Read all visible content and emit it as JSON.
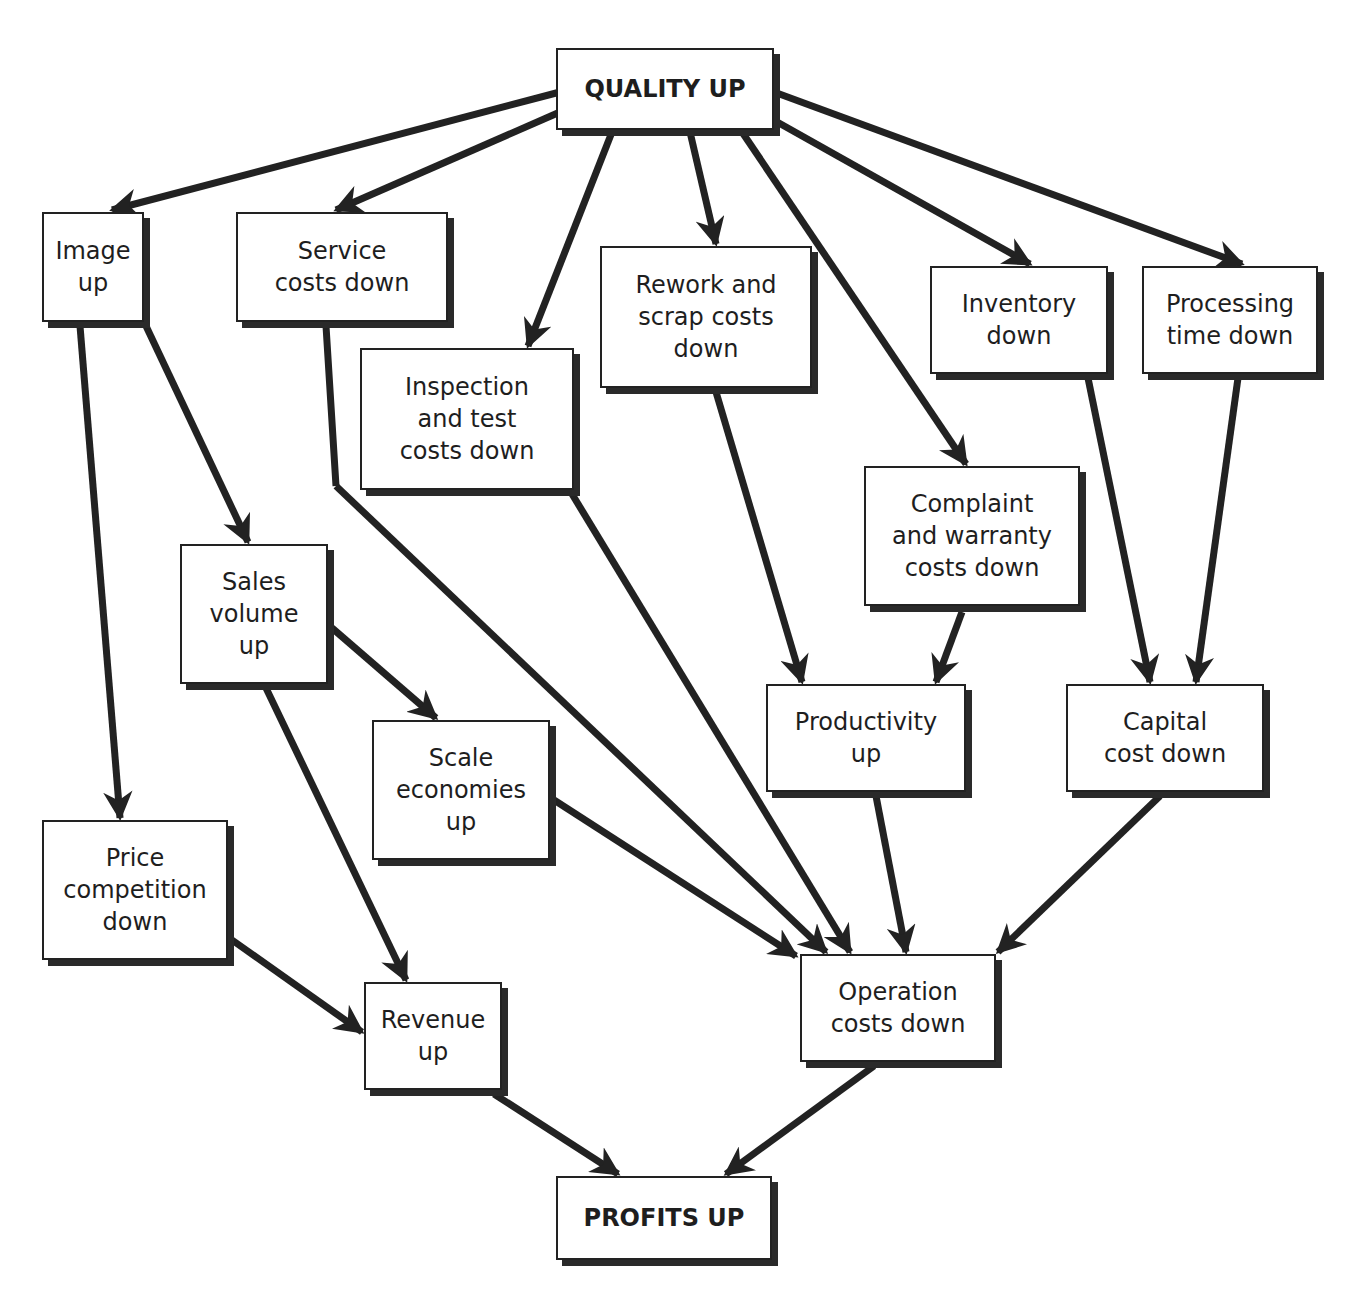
{
  "diagram": {
    "type": "flow",
    "colors": {
      "line": "#222222",
      "box_fill": "#ffffff",
      "text": "#1e1e1e"
    },
    "nodes": [
      {
        "id": "quality",
        "label": "QUALITY UP",
        "bold": true,
        "x": 556,
        "y": 48,
        "w": 218,
        "h": 82
      },
      {
        "id": "image",
        "label": "Image\nup",
        "x": 42,
        "y": 212,
        "w": 102,
        "h": 110
      },
      {
        "id": "service",
        "label": "Service\ncosts down",
        "x": 236,
        "y": 212,
        "w": 212,
        "h": 110
      },
      {
        "id": "inspection",
        "label": "Inspection\nand test\ncosts down",
        "x": 360,
        "y": 348,
        "w": 214,
        "h": 142
      },
      {
        "id": "rework",
        "label": "Rework and\nscrap costs\ndown",
        "x": 600,
        "y": 246,
        "w": 212,
        "h": 142
      },
      {
        "id": "inventory",
        "label": "Inventory\ndown",
        "x": 930,
        "y": 266,
        "w": 178,
        "h": 108
      },
      {
        "id": "processing",
        "label": "Processing\ntime down",
        "x": 1142,
        "y": 266,
        "w": 176,
        "h": 108
      },
      {
        "id": "complaint",
        "label": "Complaint\nand warranty\ncosts down",
        "x": 864,
        "y": 466,
        "w": 216,
        "h": 140
      },
      {
        "id": "sales",
        "label": "Sales\nvolume\nup",
        "x": 180,
        "y": 544,
        "w": 148,
        "h": 140
      },
      {
        "id": "scale",
        "label": "Scale\neconomies\nup",
        "x": 372,
        "y": 720,
        "w": 178,
        "h": 140
      },
      {
        "id": "productivity",
        "label": "Productivity\nup",
        "x": 766,
        "y": 684,
        "w": 200,
        "h": 108
      },
      {
        "id": "capital",
        "label": "Capital\ncost down",
        "x": 1066,
        "y": 684,
        "w": 198,
        "h": 108
      },
      {
        "id": "price",
        "label": "Price\ncompetition\ndown",
        "x": 42,
        "y": 820,
        "w": 186,
        "h": 140
      },
      {
        "id": "revenue",
        "label": "Revenue\nup",
        "x": 364,
        "y": 982,
        "w": 138,
        "h": 108
      },
      {
        "id": "operation",
        "label": "Operation\ncosts down",
        "x": 800,
        "y": 954,
        "w": 196,
        "h": 108
      },
      {
        "id": "profits",
        "label": "PROFITS UP",
        "bold": true,
        "x": 556,
        "y": 1176,
        "w": 216,
        "h": 84
      }
    ],
    "edges": [
      {
        "from": "quality",
        "to": "image",
        "x1": 560,
        "y1": 92,
        "x2": 112,
        "y2": 210
      },
      {
        "from": "quality",
        "to": "service",
        "x1": 560,
        "y1": 112,
        "x2": 336,
        "y2": 210
      },
      {
        "from": "quality",
        "to": "inspection",
        "x1": 612,
        "y1": 132,
        "x2": 528,
        "y2": 346
      },
      {
        "from": "quality",
        "to": "rework",
        "x1": 690,
        "y1": 132,
        "x2": 716,
        "y2": 244
      },
      {
        "from": "quality",
        "to": "complaint",
        "x1": 742,
        "y1": 132,
        "x2": 966,
        "y2": 464
      },
      {
        "from": "quality",
        "to": "inventory",
        "x1": 770,
        "y1": 118,
        "x2": 1030,
        "y2": 264
      },
      {
        "from": "quality",
        "to": "processing",
        "x1": 774,
        "y1": 92,
        "x2": 1242,
        "y2": 264
      },
      {
        "from": "image",
        "to": "price",
        "x1": 80,
        "y1": 326,
        "x2": 120,
        "y2": 818
      },
      {
        "from": "image",
        "to": "sales",
        "x1": 146,
        "y1": 326,
        "x2": 248,
        "y2": 542
      },
      {
        "from": "sales",
        "to": "scale",
        "x1": 332,
        "y1": 628,
        "x2": 436,
        "y2": 718
      },
      {
        "from": "sales",
        "to": "revenue",
        "x1": 266,
        "y1": 688,
        "x2": 406,
        "y2": 980
      },
      {
        "from": "price",
        "to": "revenue",
        "x1": 232,
        "y1": 940,
        "x2": 362,
        "y2": 1032
      },
      {
        "from": "service",
        "to": "operation",
        "x1": 326,
        "y1": 326,
        "x2": 336,
        "y2": 486,
        "via": true
      },
      {
        "from": "service",
        "to": "operation",
        "x1": 336,
        "y1": 486,
        "x2": 826,
        "y2": 952
      },
      {
        "from": "inspection",
        "to": "operation",
        "x1": 572,
        "y1": 494,
        "x2": 850,
        "y2": 952
      },
      {
        "from": "scale",
        "to": "operation",
        "x1": 554,
        "y1": 800,
        "x2": 796,
        "y2": 956
      },
      {
        "from": "rework",
        "to": "productivity",
        "x1": 716,
        "y1": 392,
        "x2": 802,
        "y2": 682
      },
      {
        "from": "complaint",
        "to": "productivity",
        "x1": 962,
        "y1": 612,
        "x2": 936,
        "y2": 682
      },
      {
        "from": "inventory",
        "to": "capital",
        "x1": 1088,
        "y1": 378,
        "x2": 1150,
        "y2": 682
      },
      {
        "from": "processing",
        "to": "capital",
        "x1": 1238,
        "y1": 378,
        "x2": 1196,
        "y2": 682
      },
      {
        "from": "productivity",
        "to": "operation",
        "x1": 876,
        "y1": 796,
        "x2": 906,
        "y2": 952
      },
      {
        "from": "capital",
        "to": "operation",
        "x1": 1160,
        "y1": 796,
        "x2": 998,
        "y2": 952
      },
      {
        "from": "revenue",
        "to": "profits",
        "x1": 494,
        "y1": 1094,
        "x2": 618,
        "y2": 1174
      },
      {
        "from": "operation",
        "to": "profits",
        "x1": 874,
        "y1": 1066,
        "x2": 726,
        "y2": 1174
      }
    ]
  }
}
